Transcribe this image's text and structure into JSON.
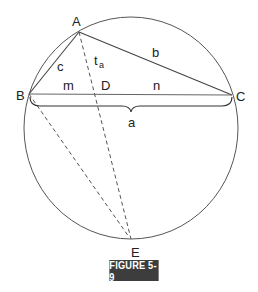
{
  "figure": {
    "caption": "FIGURE 5-9",
    "labels": {
      "A": "A",
      "B": "B",
      "C": "C",
      "D": "D",
      "E": "E",
      "a": "a",
      "b": "b",
      "c": "c",
      "m": "m",
      "n": "n",
      "t": "t",
      "t_sub": "a"
    },
    "points": {
      "A": [
        79,
        32
      ],
      "B": [
        29,
        94
      ],
      "C": [
        232,
        95
      ],
      "D": [
        103,
        95
      ],
      "E": [
        131,
        239
      ]
    },
    "circle": {
      "cx": 131,
      "cy": 128,
      "rx": 107,
      "ry": 111
    },
    "colors": {
      "line": "#555555",
      "text": "#222222",
      "caption_bg": "#3d3d3d",
      "caption_text": "#ffffff"
    }
  }
}
